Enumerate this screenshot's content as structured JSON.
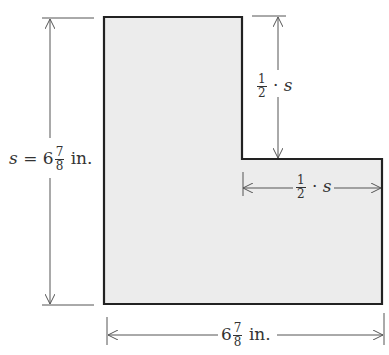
{
  "figure": {
    "type": "L-shaped region with dimension labels",
    "fill_color": "#ececec",
    "stroke_color": "#222222",
    "dimension_color": "#555555"
  },
  "labels": {
    "left_height": {
      "var": "s",
      "equals": "=",
      "whole": "6",
      "num": "7",
      "den": "8",
      "unit": "in."
    },
    "top_step_height": {
      "num": "1",
      "den": "2",
      "dot": "·",
      "var": "s"
    },
    "step_width": {
      "num": "1",
      "den": "2",
      "dot": "·",
      "var": "s"
    },
    "bottom_width": {
      "whole": "6",
      "num": "7",
      "den": "8",
      "unit": "in."
    }
  }
}
